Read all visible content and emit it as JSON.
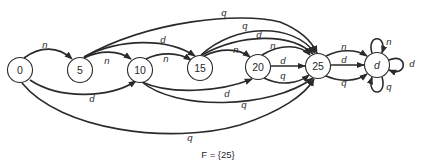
{
  "diagram": {
    "type": "finite-state-automaton",
    "caption": "F = {25}",
    "colors": {
      "stroke": "#2a2a2a",
      "background": "#ffffff"
    },
    "nodes": [
      {
        "id": "0",
        "label": "0",
        "x": 20,
        "y": 70
      },
      {
        "id": "5",
        "label": "5",
        "x": 80,
        "y": 70
      },
      {
        "id": "10",
        "label": "10",
        "x": 140,
        "y": 70
      },
      {
        "id": "15",
        "label": "15",
        "x": 200,
        "y": 68
      },
      {
        "id": "20",
        "label": "20",
        "x": 258,
        "y": 67
      },
      {
        "id": "25",
        "label": "25",
        "x": 318,
        "y": 66
      },
      {
        "id": "d",
        "label": "d",
        "x": 377,
        "y": 65
      }
    ],
    "edges": [
      {
        "from": "0",
        "to": "5",
        "label": "n"
      },
      {
        "from": "0",
        "to": "10",
        "label": "d"
      },
      {
        "from": "0",
        "to": "25",
        "label": "q"
      },
      {
        "from": "5",
        "to": "10",
        "label": "n"
      },
      {
        "from": "5",
        "to": "15",
        "label": "d"
      },
      {
        "from": "5",
        "to": "25",
        "label": "q"
      },
      {
        "from": "10",
        "to": "15",
        "label": "n"
      },
      {
        "from": "10",
        "to": "20",
        "label": "d"
      },
      {
        "from": "10",
        "to": "25",
        "label": "q"
      },
      {
        "from": "15",
        "to": "20",
        "label": "n"
      },
      {
        "from": "15",
        "to": "25",
        "label": "d"
      },
      {
        "from": "15",
        "to": "25",
        "label": "q"
      },
      {
        "from": "20",
        "to": "25",
        "label": "n"
      },
      {
        "from": "20",
        "to": "25",
        "label": "d"
      },
      {
        "from": "20",
        "to": "25",
        "label": "q"
      },
      {
        "from": "25",
        "to": "d",
        "label": "n"
      },
      {
        "from": "25",
        "to": "d",
        "label": "d"
      },
      {
        "from": "25",
        "to": "d",
        "label": "q"
      },
      {
        "from": "d",
        "to": "d",
        "label": "n"
      },
      {
        "from": "d",
        "to": "d",
        "label": "d"
      },
      {
        "from": "d",
        "to": "d",
        "label": "q"
      }
    ],
    "labels": {
      "e_0_5": "n",
      "e_0_10": "d",
      "e_0_25": "q",
      "e_5_10": "n",
      "e_5_15": "d",
      "e_5_25": "q",
      "e_10_15": "n",
      "e_10_20": "d",
      "e_10_25": "q",
      "e_15_20": "n",
      "e_15_25_d": "d",
      "e_15_25_q": "q",
      "e_20_25_n": "n",
      "e_20_25_d": "d",
      "e_20_25_q": "q",
      "e_25_d_n": "n",
      "e_25_d_d": "d",
      "e_25_d_q": "q",
      "loop_n": "n",
      "loop_d": "d",
      "loop_q": "q"
    }
  }
}
